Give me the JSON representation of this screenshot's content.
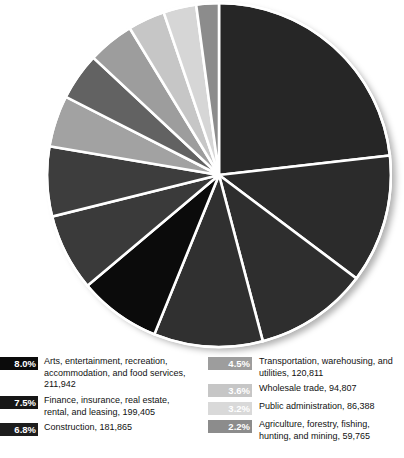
{
  "headline": {
    "title_fragment": "b?",
    "subtitle_fragment": "es"
  },
  "chart_data": {
    "type": "pie",
    "title": "",
    "legend_position": "bottom",
    "grid": false,
    "unit": "jobs",
    "start_angle_deg": 0,
    "direction": "clockwise",
    "categories": [
      "Educational services, health care, and social assistance",
      "Professional, scientific, management, administrative, and waste management services",
      "Manufacturing",
      "Retail trade",
      "Arts, entertainment, recreation, accommodation, and food services",
      "Finance, insurance, real estate, rental, and leasing",
      "Construction",
      "Other services, except public administration",
      "Information",
      "Transportation, warehousing, and utilities",
      "Wholesale trade",
      "Public administration",
      "Agriculture, forestry, fishing, hunting, and mining"
    ],
    "values": [
      24.0,
      12.5,
      11.0,
      10.6,
      8.0,
      7.5,
      6.8,
      5.0,
      4.6,
      4.5,
      3.6,
      3.2,
      2.2
    ],
    "colors": [
      "#262626",
      "#2b2b2b",
      "#2e2e2e",
      "#303030",
      "#0b0b0b",
      "#3a3a3a",
      "#3d3d3d",
      "#a2a2a2",
      "#626262",
      "#9d9d9d",
      "#c6c6c6",
      "#d6d6d6",
      "#8c8c8c"
    ],
    "xlabel": "",
    "ylabel": ""
  },
  "legend": {
    "columns": [
      {
        "name": "legend-column-left",
        "items": [
          {
            "percent": "8.0%",
            "label": "Arts, entertainment, recreation,\naccommodation, and food services,\n211,942",
            "swatch_color": "#0b0b0b",
            "percent_color": "#ffffff"
          },
          {
            "percent": "7.5%",
            "label": "Finance, insurance, real estate,\nrental, and leasing, 199,405",
            "swatch_color": "#161616",
            "percent_color": "#ffffff"
          },
          {
            "percent": "6.8%",
            "label": "Construction, 181,865",
            "swatch_color": "#1d1d1d",
            "percent_color": "#ffffff"
          }
        ]
      },
      {
        "name": "legend-column-right",
        "items": [
          {
            "percent": "4.5%",
            "label": "Transportation, warehousing, and\nutilities, 120,811",
            "swatch_color": "#9d9d9d",
            "percent_color": "#ffffff"
          },
          {
            "percent": "3.6%",
            "label": "Wholesale trade, 94,807",
            "swatch_color": "#c6c6c6",
            "percent_color": "#ffffff"
          },
          {
            "percent": "3.2%",
            "label": "Public administration, 86,388",
            "swatch_color": "#d9d9d9",
            "percent_color": "#ffffff"
          },
          {
            "percent": "2.2%",
            "label": "Agriculture, forestry, fishing,\nhunting, and mining, 59,765",
            "swatch_color": "#8c8c8c",
            "percent_color": "#ffffff"
          }
        ]
      }
    ]
  }
}
